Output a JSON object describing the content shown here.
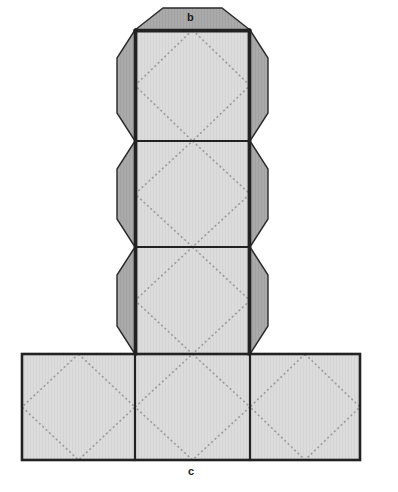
{
  "figure": {
    "type": "geometry-net",
    "shape_name": "cube-net",
    "labels": [
      {
        "id": "b",
        "text": "b",
        "x": 190,
        "y": 17,
        "position": "top-edge-of-top-square"
      },
      {
        "id": "c",
        "text": "c",
        "x": 191,
        "y": 471,
        "position": "bottom-edge-of-bottom-row"
      }
    ],
    "colors": {
      "square_fill": "#dadada",
      "flap_fill": "#a9a9a9",
      "outline": "#222222",
      "divider": "#222222",
      "diamond_dotted": "#9b9b9b",
      "background": "#ffffff",
      "label_color": "#1a1a1a"
    },
    "geometry": {
      "column_left": 135,
      "column_right": 250,
      "column_top": 30,
      "cell_size": 107,
      "row_dividers_y": [
        30,
        141,
        247,
        354
      ],
      "bottom_row_top": 354,
      "bottom_row_bottom": 460,
      "bottom_row_left": 22,
      "bottom_row_right": 360,
      "bottom_col_dividers_x": [
        22,
        135,
        250,
        360
      ],
      "flap_left_x": 117,
      "flap_right_x": 268,
      "flap_corner_inset": 28
    },
    "cells": [
      {
        "id": "cell-top",
        "row": 0,
        "col": 1,
        "x": 135,
        "y": 30,
        "w": 115,
        "h": 111,
        "diamond": true
      },
      {
        "id": "cell-upper-mid",
        "row": 1,
        "col": 1,
        "x": 135,
        "y": 141,
        "w": 115,
        "h": 106,
        "diamond": true
      },
      {
        "id": "cell-lower-mid",
        "row": 2,
        "col": 1,
        "x": 135,
        "y": 247,
        "w": 115,
        "h": 107,
        "diamond": true
      },
      {
        "id": "cell-bottom-left",
        "row": 3,
        "col": 0,
        "x": 22,
        "y": 354,
        "w": 113,
        "h": 106,
        "diamond": true
      },
      {
        "id": "cell-bottom-mid",
        "row": 3,
        "col": 1,
        "x": 135,
        "y": 354,
        "w": 115,
        "h": 106,
        "diamond": true
      },
      {
        "id": "cell-bottom-right",
        "row": 3,
        "col": 2,
        "x": 250,
        "y": 354,
        "w": 110,
        "h": 106,
        "diamond": true
      }
    ],
    "flaps": [
      {
        "id": "flap-top",
        "side": "top",
        "attached_to": "cell-top"
      },
      {
        "id": "flap-left-top",
        "side": "left",
        "attached_to": "cell-top"
      },
      {
        "id": "flap-right-top",
        "side": "right",
        "attached_to": "cell-top"
      },
      {
        "id": "flap-left-upper",
        "side": "left",
        "attached_to": "cell-upper-mid"
      },
      {
        "id": "flap-right-upper",
        "side": "right",
        "attached_to": "cell-upper-mid"
      },
      {
        "id": "flap-left-lower",
        "side": "left",
        "attached_to": "cell-lower-mid"
      },
      {
        "id": "flap-right-lower",
        "side": "right",
        "attached_to": "cell-lower-mid"
      }
    ]
  }
}
